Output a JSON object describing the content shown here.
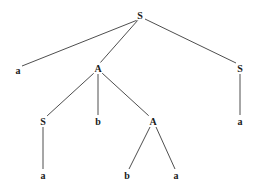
{
  "diagram": {
    "type": "parse-tree",
    "background_ghost_text": [
      {
        "text": "…ution: Sketch of a Step in ope…",
        "x": 148,
        "y": 14
      },
      {
        "text": "…",
        "x": 160,
        "y": 50
      }
    ],
    "nodes": [
      {
        "id": "n0",
        "label": "S",
        "x": 140,
        "y": 15
      },
      {
        "id": "n1",
        "label": "a",
        "x": 18,
        "y": 70
      },
      {
        "id": "n2",
        "label": "A",
        "x": 98,
        "y": 68
      },
      {
        "id": "n3",
        "label": "S",
        "x": 240,
        "y": 68
      },
      {
        "id": "n4",
        "label": "S",
        "x": 43,
        "y": 121
      },
      {
        "id": "n5",
        "label": "b",
        "x": 98,
        "y": 121
      },
      {
        "id": "n6",
        "label": "A",
        "x": 153,
        "y": 121
      },
      {
        "id": "n7",
        "label": "a",
        "x": 240,
        "y": 121
      },
      {
        "id": "n8",
        "label": "a",
        "x": 43,
        "y": 175
      },
      {
        "id": "n9",
        "label": "b",
        "x": 127,
        "y": 175
      },
      {
        "id": "n10",
        "label": "a",
        "x": 176,
        "y": 175
      }
    ],
    "edges": [
      [
        "n0",
        "n1"
      ],
      [
        "n0",
        "n2"
      ],
      [
        "n0",
        "n3"
      ],
      [
        "n2",
        "n4"
      ],
      [
        "n2",
        "n5"
      ],
      [
        "n2",
        "n6"
      ],
      [
        "n3",
        "n7"
      ],
      [
        "n4",
        "n8"
      ],
      [
        "n6",
        "n9"
      ],
      [
        "n6",
        "n10"
      ]
    ]
  }
}
